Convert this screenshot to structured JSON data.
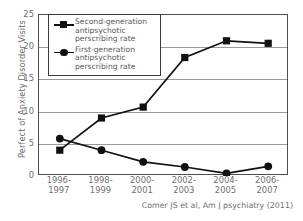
{
  "chart_data": {
    "type": "line",
    "title": "",
    "xlabel": "",
    "ylabel": "Perfect of Anxiety Disorder Visits",
    "categories": [
      "1996-\n1997",
      "1998-\n1999",
      "2000-\n2001",
      "2002-\n2003",
      "2004-\n2005",
      "2006-\n2007"
    ],
    "x_tick_lines": [
      [
        "1996-",
        "1997"
      ],
      [
        "1998-",
        "1999"
      ],
      [
        "2000-",
        "2001"
      ],
      [
        "2002-",
        "2003"
      ],
      [
        "2004-",
        "2005"
      ],
      [
        "2006-",
        "2007"
      ]
    ],
    "ylim": [
      0,
      25
    ],
    "yticks": [
      0,
      5,
      10,
      15,
      20,
      25
    ],
    "ytick_labels": [
      "0",
      "5",
      "10",
      "15",
      "20",
      "25"
    ],
    "grid": true,
    "grid_axis": "y",
    "legend_position": "upper left",
    "series": [
      {
        "name": "Second-generation antipsychotic perscribing rate",
        "marker": "square",
        "color": "#111111",
        "values": [
          4.0,
          9.0,
          10.7,
          18.4,
          21.0,
          20.6
        ]
      },
      {
        "name": "First-generation antipsychotic perscribing rate",
        "marker": "circle",
        "color": "#111111",
        "values": [
          5.8,
          4.0,
          2.2,
          1.4,
          0.4,
          1.5
        ]
      }
    ],
    "annotations": [
      "Comer JS et al, Am J psychiatry  (2011)"
    ]
  },
  "legend": {
    "entries": [
      {
        "marker_icon": "square-marker-icon",
        "lines": [
          "Second-generation",
          "antipsychotic",
          "perscribing rate"
        ]
      },
      {
        "marker_icon": "circle-marker-icon",
        "lines": [
          "First-generation",
          "antipsychotic",
          "perscribing rate"
        ]
      }
    ]
  },
  "citation": {
    "text": "Comer JS et al, Am J psychiatry  (2011)"
  },
  "colors": {
    "line": "#111111",
    "frame": "#4f4f4f",
    "grid": "#9a9a9a",
    "text": "#6f6f6f",
    "background": "#ffffff"
  }
}
